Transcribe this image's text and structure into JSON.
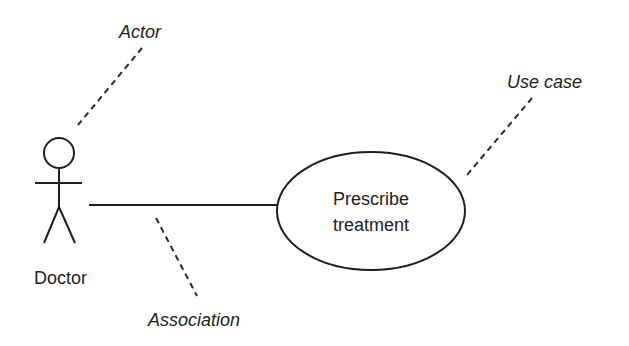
{
  "diagram": {
    "type": "UML use case diagram",
    "actor": {
      "name": "Doctor"
    },
    "use_case": {
      "line1": "Prescribe",
      "line2": "treatment"
    },
    "annotations": {
      "actor_label": "Actor",
      "use_case_label": "Use case",
      "association_label": "Association"
    },
    "relationships": [
      {
        "type": "association",
        "from": "Doctor",
        "to": "Prescribe treatment"
      }
    ]
  }
}
